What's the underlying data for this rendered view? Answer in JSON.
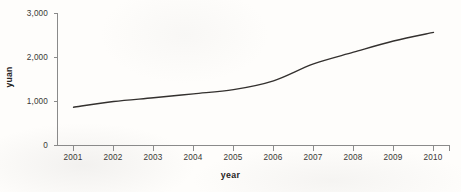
{
  "chart_data": {
    "type": "line",
    "title": "",
    "xlabel": "year",
    "ylabel": "yuan",
    "categories": [
      "2001",
      "2002",
      "2003",
      "2004",
      "2005",
      "2006",
      "2007",
      "2008",
      "2009",
      "2010"
    ],
    "x": [
      2001,
      2002,
      2003,
      2004,
      2005,
      2006,
      2007,
      2008,
      2009,
      2010
    ],
    "values": [
      870,
      1000,
      1085,
      1175,
      1270,
      1470,
      1855,
      2120,
      2375,
      2570
    ],
    "series": [
      {
        "name": "yuan",
        "values": [
          870,
          1000,
          1085,
          1175,
          1270,
          1470,
          1855,
          2120,
          2375,
          2570
        ],
        "color": "#33302e"
      }
    ],
    "ylim": [
      0,
      3000
    ],
    "yticks": [
      0,
      1000,
      2000,
      3000
    ],
    "ytick_labels": [
      "0",
      "1,000",
      "2,000",
      "3,000"
    ],
    "xlim": [
      2001,
      2010
    ],
    "grid": false,
    "legend": false,
    "legend_position": "none"
  },
  "axes": {
    "y_title": "yuan",
    "x_title": "year",
    "y_tick_labels": [
      "3,000",
      "2,000",
      "1,000",
      "0"
    ],
    "x_tick_labels": [
      "2001",
      "2002",
      "2003",
      "2004",
      "2005",
      "2006",
      "2007",
      "2008",
      "2009",
      "2010"
    ]
  },
  "colors": {
    "background": "#fefdfb",
    "line": "#33302e",
    "axis": "#8a8a8a",
    "text": "#3a3836"
  }
}
